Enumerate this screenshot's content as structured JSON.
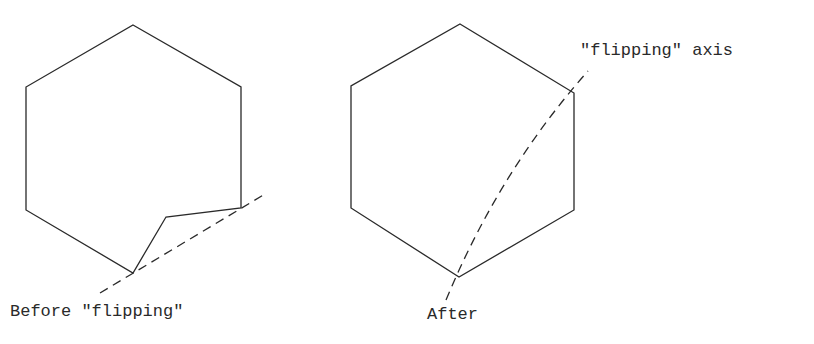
{
  "figure": {
    "left_panel": {
      "caption": "Before \"flipping\"",
      "hexagon_points": [
        [
          133,
          25
        ],
        [
          241,
          87
        ],
        [
          241,
          208
        ],
        [
          166,
          217
        ],
        [
          133,
          273
        ],
        [
          26,
          210
        ],
        [
          26,
          87
        ]
      ],
      "axis_line": {
        "x1": 100,
        "y1": 293,
        "x2": 265,
        "y2": 194,
        "style": "dashed"
      }
    },
    "right_panel": {
      "caption": "After",
      "hexagon_points": [
        [
          460,
          24
        ],
        [
          574,
          93
        ],
        [
          574,
          210
        ],
        [
          459,
          277
        ],
        [
          351,
          208
        ],
        [
          351,
          86
        ]
      ],
      "axis_line": {
        "path": "M446,300 Q500,170 588,71",
        "style": "dashed"
      },
      "axis_label": "\"flipping\" axis"
    },
    "colors": {
      "stroke": "#2a2a2a",
      "background": "#ffffff"
    }
  }
}
